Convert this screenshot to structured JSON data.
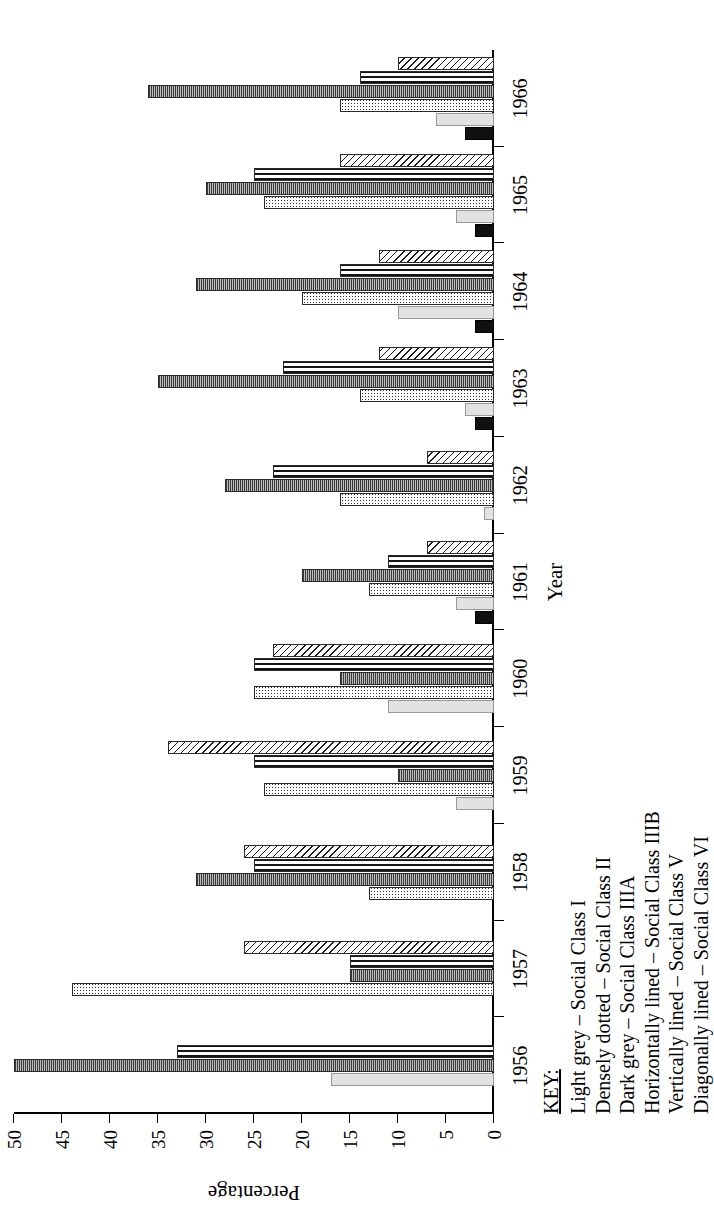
{
  "chart_data": {
    "type": "bar",
    "title": "",
    "xlabel": "Year",
    "ylabel": "Percentage",
    "ylim": [
      0,
      50
    ],
    "ytick_labels": [
      "0",
      "5",
      "10",
      "15",
      "20",
      "25",
      "30",
      "35",
      "40",
      "45",
      "50"
    ],
    "ytick_values": [
      0,
      5,
      10,
      15,
      20,
      25,
      30,
      35,
      40,
      45,
      50
    ],
    "grid": false,
    "legend_position": "below-plot",
    "categories": [
      "1956",
      "1957",
      "1958",
      "1959",
      "1960",
      "1961",
      "1962",
      "1963",
      "1964",
      "1965",
      "1966"
    ],
    "series": [
      {
        "name": "Light grey – Social Class I",
        "pattern": "light-grey",
        "values": [
          17,
          0,
          0,
          4,
          11,
          4,
          1,
          3,
          10,
          4,
          6
        ]
      },
      {
        "name": "Densely dotted – Social Class II",
        "pattern": "densely-dotted",
        "values": [
          0,
          44,
          13,
          24,
          25,
          13,
          16,
          14,
          20,
          24,
          16
        ]
      },
      {
        "name": "Dark grey – Social Class IIIA",
        "pattern": "dark-grey",
        "values": [
          0,
          0,
          0,
          0,
          0,
          2,
          0,
          2,
          2,
          2,
          3
        ]
      },
      {
        "name": "Horizontally lined – Social Class IIIB",
        "pattern": "horizontally-lined",
        "values": [
          33,
          15,
          25,
          25,
          25,
          11,
          23,
          22,
          16,
          25,
          14
        ]
      },
      {
        "name": "Vertically lined – Social Class V",
        "pattern": "vertically-lined",
        "values": [
          50,
          15,
          31,
          10,
          16,
          20,
          28,
          35,
          31,
          30,
          36
        ]
      },
      {
        "name": "Diagonally lined – Social Class VI",
        "pattern": "diagonally-lined",
        "values": [
          0,
          26,
          26,
          34,
          23,
          7,
          7,
          12,
          12,
          16,
          10
        ]
      }
    ],
    "bar_order_in_group": [
      "Dark grey – Social Class IIIA",
      "Light grey – Social Class I",
      "Densely dotted – Social Class II",
      "Vertically lined – Social Class V",
      "Horizontally lined – Social Class IIIB",
      "Diagonally lined – Social Class VI"
    ]
  },
  "axes": {
    "y_label": "Percentage",
    "x_label": "Year"
  },
  "key": {
    "title": "KEY:",
    "entries": [
      "Light grey – Social Class I",
      "Densely dotted – Social Class II",
      "Dark grey – Social Class IIIA",
      "Horizontally lined – Social Class IIIB",
      "Vertically lined – Social Class V",
      "Diagonally lined – Social Class VI"
    ]
  }
}
